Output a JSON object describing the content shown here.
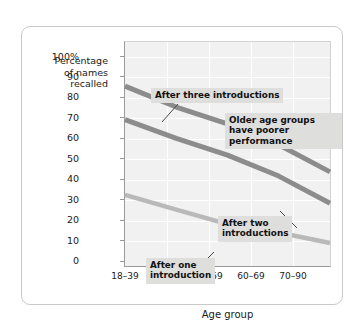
{
  "chart_data": {
    "type": "line",
    "title": "",
    "xlabel": "Age group",
    "ylabel": "Percentage of names recalled",
    "categories": [
      "18–39",
      "40–49",
      "50–59",
      "60–69",
      "70–90"
    ],
    "ylim": [
      0,
      100
    ],
    "yticks": [
      "0",
      "10",
      "20",
      "30",
      "40",
      "50",
      "60",
      "70",
      "80",
      "90",
      "100%"
    ],
    "ytick_values": [
      0,
      10,
      20,
      30,
      40,
      50,
      60,
      70,
      80,
      90,
      100
    ],
    "grid": true,
    "legend_position": "none",
    "series": [
      {
        "name": "After three introductions",
        "color": "#8c8c8c",
        "values": [
          86,
          76,
          68,
          58,
          45
        ]
      },
      {
        "name": "After two introductions",
        "color": "#8c8c8c",
        "values": [
          70,
          61,
          53,
          43,
          30
        ]
      },
      {
        "name": "After one introduction",
        "color": "#b9b9b9",
        "values": [
          34,
          27,
          20,
          16,
          11
        ]
      }
    ],
    "annotations": [
      {
        "id": "three",
        "text": "After three introductions"
      },
      {
        "id": "older",
        "text": "Older age groups\nhave poorer performance"
      },
      {
        "id": "two",
        "text": "After two\nintroductions"
      },
      {
        "id": "one",
        "text": "After one\nintroduction"
      }
    ]
  },
  "axis": {
    "y_title_line1": "Percentage",
    "y_title_line2": "of names",
    "y_title_line3": "recalled",
    "x_title": "Age group"
  },
  "yticks": {
    "t100": "100%",
    "t90": "90",
    "t80": "80",
    "t70": "70",
    "t60": "60",
    "t50": "50",
    "t40": "40",
    "t30": "30",
    "t20": "20",
    "t10": "10",
    "t0": "0"
  },
  "xticks": {
    "c0": "18–39",
    "c1": "40–49",
    "c2": "50–59",
    "c3": "60–69",
    "c4": "70–90"
  },
  "annotations": {
    "three": "After three introductions",
    "older": "Older age groups\nhave poorer performance",
    "two": "After two\nintroductions",
    "one": "After one\nintroduction"
  },
  "colors": {
    "line_dark": "#8c8c8c",
    "line_light": "#b9b9b9",
    "plot_bg": "#f1f1f1",
    "annot_bg": "#dededd",
    "frame": "#c9c9c9"
  }
}
